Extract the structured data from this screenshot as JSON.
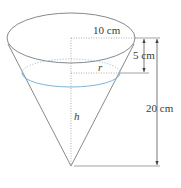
{
  "diagram": {
    "type": "inverted-cone-with-water",
    "labels": {
      "top_radius": "10 cm",
      "depth_gap": "5 cm",
      "water_radius": "r",
      "water_height": "h",
      "total_height": "20 cm"
    },
    "colors": {
      "outline": "#7a7a7a",
      "water_surface": "#7fb3d9",
      "dotted": "#9a9a9a",
      "text": "#3a3a3a"
    }
  }
}
